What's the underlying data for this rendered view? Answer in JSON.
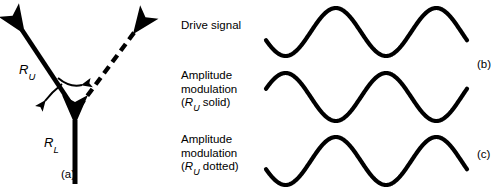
{
  "figure": {
    "width": 504,
    "height": 194,
    "background": "#ffffff",
    "stroke_color": "#000000"
  },
  "panel_a": {
    "part_label": "(a)",
    "vectors": [
      {
        "name": "R_U",
        "label_main": "R",
        "label_sub": "U",
        "style": "solid",
        "direction": "up-left",
        "from": [
          75,
          110
        ],
        "to": [
          16,
          22
        ]
      },
      {
        "name": "R_U_rotated",
        "label_main": "",
        "label_sub": "",
        "style": "dashed",
        "direction": "up-right",
        "from": [
          78,
          108
        ],
        "to": [
          143,
          22
        ]
      },
      {
        "name": "R_L",
        "label_main": "R",
        "label_sub": "L",
        "style": "solid",
        "direction": "up",
        "from": [
          75,
          182
        ],
        "to": [
          75,
          112
        ]
      }
    ],
    "rotation_arrows": [
      {
        "name": "arc-clockwise",
        "direction": "right"
      },
      {
        "name": "arc-counterclockwise",
        "direction": "left"
      }
    ]
  },
  "panel_b": {
    "rows": [
      {
        "id": "drive-signal",
        "caption_lines": [
          "Drive signal"
        ],
        "part_label": "",
        "wave": {
          "amplitude": 24,
          "phase_deg": 200,
          "cycles": 2.0,
          "baseline_y": 32,
          "line_width": 4.2
        }
      },
      {
        "id": "amplitude-modulation-solid",
        "caption_lines": [
          "Amplitude",
          "modulation",
          "(R_U solid)"
        ],
        "caption_italic_line": 2,
        "part_label": "(b)",
        "wave": {
          "amplitude": 24,
          "phase_deg": 20,
          "cycles": 2.0,
          "baseline_y": 97,
          "line_width": 4.2
        }
      },
      {
        "id": "amplitude-modulation-dotted",
        "caption_lines": [
          "Amplitude",
          "modulation",
          "(R_U dotted)"
        ],
        "caption_italic_line": 2,
        "part_label": "(c)",
        "wave": {
          "amplitude": 24,
          "phase_deg": 200,
          "cycles": 2.0,
          "baseline_y": 161,
          "line_width": 4.2
        }
      }
    ],
    "captions": {
      "drive_signal": "Drive signal",
      "amplitude": "Amplitude",
      "modulation": "modulation",
      "ru_solid_open": "(",
      "ru_solid_r": "R",
      "ru_solid_sub": "U",
      "ru_solid_tail": " solid)",
      "ru_dotted_open": "(",
      "ru_dotted_r": "R",
      "ru_dotted_sub": "U",
      "ru_dotted_tail": " dotted)"
    },
    "part_labels": {
      "b": "(b)",
      "c": "(c)"
    }
  }
}
